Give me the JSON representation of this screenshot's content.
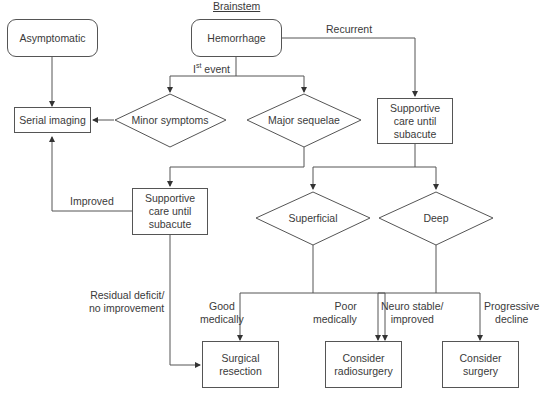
{
  "title": "Brainstem",
  "nodes": {
    "asymptomatic": "Asymptomatic",
    "hemorrhage": "Hemorrhage",
    "serial_imaging": "Serial imaging",
    "minor_symptoms": "Minor symptoms",
    "major_sequelae": "Major sequelae",
    "supportive_care_right": "Supportive care until subacute",
    "supportive_care_left": "Supportive care until subacute",
    "superficial": "Superficial",
    "deep": "Deep",
    "surgical_resection": "Surgical resection",
    "consider_radiosurgery": "Consider radiosurgery",
    "consider_surgery": "Consider surgery"
  },
  "edge_labels": {
    "first_event_prefix": "I",
    "first_event_sup": "st",
    "first_event_suffix": " event",
    "recurrent": "Recurrent",
    "improved": "Improved",
    "residual_deficit_line1": "Residual deficit/",
    "residual_deficit_line2": "no improvement",
    "good_medically_line1": "Good",
    "good_medically_line2": "medically",
    "poor_medically_line1": "Poor",
    "poor_medically_line2": "medically",
    "neuro_stable_line1": "Neuro stable/",
    "neuro_stable_line2": "improved",
    "progressive_line1": "Progressive",
    "progressive_line2": "decline"
  },
  "colors": {
    "line": "#555555",
    "text": "#3a3a3a",
    "background": "#ffffff"
  }
}
